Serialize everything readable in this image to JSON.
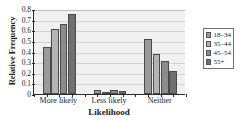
{
  "chart_data": {
    "type": "bar",
    "title": "",
    "xlabel": "Likelihood",
    "ylabel": "Relative Frequency",
    "categories": [
      "More likely",
      "Less likely",
      "Neither"
    ],
    "ylim": [
      0,
      0.8
    ],
    "yticks": [
      "0",
      "0.1",
      "0.2",
      "0.3",
      "0.4",
      "0.5",
      "0.6",
      "0.7",
      "0.8"
    ],
    "ytick_values": [
      0,
      0.1,
      0.2,
      0.3,
      0.4,
      0.5,
      0.6,
      0.7,
      0.8
    ],
    "grid": true,
    "legend_position": "right",
    "series": [
      {
        "name": "18–34",
        "color": "#9a9a9a",
        "values": [
          0.44,
          0.04,
          0.52
        ]
      },
      {
        "name": "35–44",
        "color": "#b4b4b4",
        "values": [
          0.61,
          0.01,
          0.38
        ]
      },
      {
        "name": "45–54",
        "color": "#8c8c8c",
        "values": [
          0.66,
          0.04,
          0.31
        ]
      },
      {
        "name": "55+",
        "color": "#6f6f6f",
        "values": [
          0.75,
          0.03,
          0.22
        ]
      }
    ]
  },
  "style": {
    "plot_background": "#f0f0f0",
    "axis_color": "#2a2a2a",
    "gridline_color": "#d2d2d2",
    "legend_border": "#6e6e6e"
  }
}
